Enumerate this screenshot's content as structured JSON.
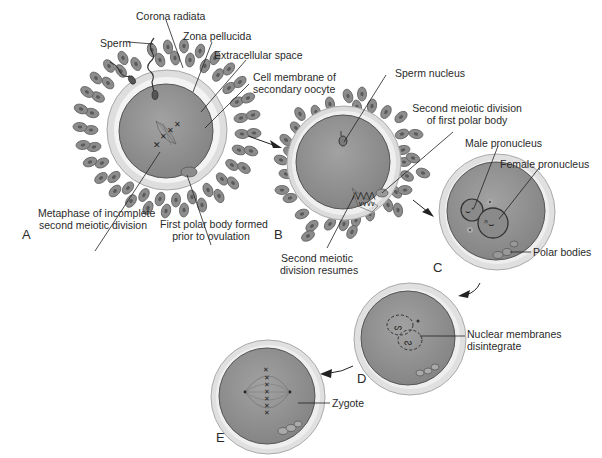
{
  "figure": {
    "stages": [
      {
        "id": "A",
        "letter": "A"
      },
      {
        "id": "B",
        "letter": "B"
      },
      {
        "id": "C",
        "letter": "C"
      },
      {
        "id": "D",
        "letter": "D"
      },
      {
        "id": "E",
        "letter": "E"
      }
    ],
    "labels": {
      "corona_radiata": "Corona radiata",
      "sperm": "Sperm",
      "zona_pellucida": "Zona pellucida",
      "extracellular_space": "Extracellular space",
      "cell_membrane_1": "Cell membrane of",
      "cell_membrane_2": "secondary oocyte",
      "metaphase_1": "Metaphase of incomplete",
      "metaphase_2": "second meiotic division",
      "first_polar_1": "First polar body formed",
      "first_polar_2": "prior to ovulation",
      "sperm_nucleus": "Sperm nucleus",
      "second_meiotic_polar_1": "Second meiotic division",
      "second_meiotic_polar_2": "of first polar body",
      "second_meiotic_resumes_1": "Second meiotic",
      "second_meiotic_resumes_2": "division resumes",
      "male_pronucleus": "Male pronucleus",
      "female_pronucleus": "Female pronucleus",
      "polar_bodies": "Polar bodies",
      "nuclear_membranes_1": "Nuclear membranes",
      "nuclear_membranes_2": "disintegrate",
      "zygote": "Zygote"
    },
    "colors": {
      "cytoplasm": "#8f8f8f",
      "zona": "#dcdcdc",
      "corona_cell": "#8a8a8a",
      "corona_nucleus": "#5a5a5a",
      "line": "#222222",
      "text": "#2a2a2a"
    }
  }
}
